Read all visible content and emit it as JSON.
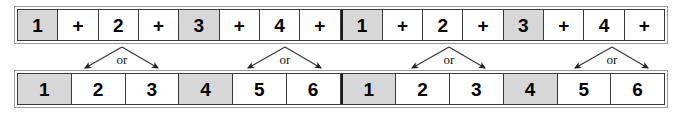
{
  "figure": {
    "colors": {
      "shaded_cell": "#d7d7d7",
      "plain_cell": "#ffffff",
      "cell_border": "#3a3a3a",
      "outer_frame": "#9a9a9a",
      "group_divider": "#1a1a1a",
      "text": "#000000",
      "connector_line": "#333333"
    }
  },
  "top_row": {
    "name": "top-row",
    "cell_count": 16,
    "cells": [
      {
        "label": "1",
        "shaded": true,
        "group_start": false
      },
      {
        "label": "+",
        "shaded": false,
        "group_start": false
      },
      {
        "label": "2",
        "shaded": false,
        "group_start": false
      },
      {
        "label": "+",
        "shaded": false,
        "group_start": false
      },
      {
        "label": "3",
        "shaded": true,
        "group_start": false
      },
      {
        "label": "+",
        "shaded": false,
        "group_start": false
      },
      {
        "label": "4",
        "shaded": false,
        "group_start": false
      },
      {
        "label": "+",
        "shaded": false,
        "group_start": false
      },
      {
        "label": "1",
        "shaded": true,
        "group_start": true
      },
      {
        "label": "+",
        "shaded": false,
        "group_start": false
      },
      {
        "label": "2",
        "shaded": false,
        "group_start": false
      },
      {
        "label": "+",
        "shaded": false,
        "group_start": false
      },
      {
        "label": "3",
        "shaded": true,
        "group_start": false
      },
      {
        "label": "+",
        "shaded": false,
        "group_start": false
      },
      {
        "label": "4",
        "shaded": false,
        "group_start": false
      },
      {
        "label": "+",
        "shaded": false,
        "group_start": false
      }
    ]
  },
  "bottom_row": {
    "name": "bottom-row",
    "cell_count": 12,
    "cells": [
      {
        "label": "1",
        "shaded": true,
        "group_start": false
      },
      {
        "label": "2",
        "shaded": false,
        "group_start": false
      },
      {
        "label": "3",
        "shaded": false,
        "group_start": false
      },
      {
        "label": "4",
        "shaded": true,
        "group_start": false
      },
      {
        "label": "5",
        "shaded": false,
        "group_start": false
      },
      {
        "label": "6",
        "shaded": false,
        "group_start": false
      },
      {
        "label": "1",
        "shaded": true,
        "group_start": true
      },
      {
        "label": "2",
        "shaded": false,
        "group_start": false
      },
      {
        "label": "3",
        "shaded": false,
        "group_start": false
      },
      {
        "label": "4",
        "shaded": true,
        "group_start": false
      },
      {
        "label": "5",
        "shaded": false,
        "group_start": false
      },
      {
        "label": "6",
        "shaded": false,
        "group_start": false
      }
    ]
  },
  "connectors": [
    {
      "label": "or",
      "apex_x": 122,
      "apex_y": 47,
      "left_x": 85,
      "left_y": 68,
      "right_x": 158,
      "right_y": 68,
      "label_x": 122,
      "label_y": 59
    },
    {
      "label": "or",
      "apex_x": 285,
      "apex_y": 47,
      "left_x": 248,
      "left_y": 68,
      "right_x": 321,
      "right_y": 68,
      "label_x": 285,
      "label_y": 59
    },
    {
      "label": "or",
      "apex_x": 449,
      "apex_y": 47,
      "left_x": 412,
      "left_y": 68,
      "right_x": 485,
      "right_y": 68,
      "label_x": 449,
      "label_y": 59
    },
    {
      "label": "or",
      "apex_x": 612,
      "apex_y": 47,
      "left_x": 575,
      "left_y": 68,
      "right_x": 648,
      "right_y": 68,
      "label_x": 612,
      "label_y": 59
    }
  ]
}
